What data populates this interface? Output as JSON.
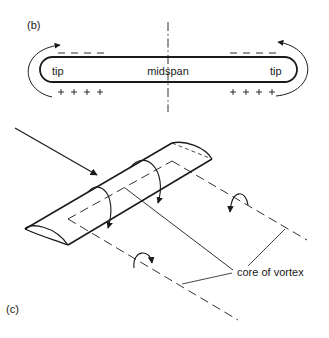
{
  "panel_b": {
    "label": "(b)",
    "left_tip_label": "tip",
    "midspan_label": "midspan",
    "right_tip_label": "tip",
    "upper_surface_sign": "– – – –",
    "lower_surface_sign": "+ + + +"
  },
  "panel_c": {
    "label": "(c)",
    "core_label": "core of vortex"
  },
  "colors": {
    "ink": "#1a1a1a",
    "background": "#ffffff"
  }
}
